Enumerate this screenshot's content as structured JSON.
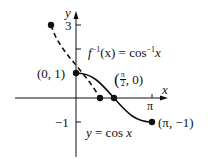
{
  "figure": {
    "type": "function-graph-with-inverse",
    "axes": {
      "x_label": "x",
      "y_label": "y",
      "y_ticks": [
        {
          "label": "3",
          "value": 3
        },
        {
          "label": "",
          "value": 2
        },
        {
          "label": "−1",
          "value": -1
        }
      ],
      "x_ticks": [
        {
          "label": "π",
          "value": 3.14159
        }
      ]
    },
    "curves": [
      {
        "name": "cosine",
        "label": "y = cos x",
        "style": "solid",
        "domain": "[0, π]"
      },
      {
        "name": "inverse-cosine",
        "label": "f⁻¹(x) = cos⁻¹ x",
        "style": "dashed",
        "domain": "[−1, 1]"
      }
    ],
    "points": [
      {
        "label": "(0, 1)"
      },
      {
        "label_num": "π",
        "label_den": "2",
        "label": "(π/2, 0)"
      },
      {
        "label": "(π, −1)"
      },
      {
        "label": "(−1, π)"
      }
    ],
    "labels": {
      "inverse_prefix": "f",
      "inverse_sup": "−1",
      "inverse_rest": "(x) = cos",
      "inverse_sup2": "−1",
      "inverse_var": "x",
      "cos_y": "y",
      "cos_eq": " = cos ",
      "cos_x": "x",
      "point_0_1": "(0, 1)",
      "point_pi_m1": "(π, −1)",
      "point_half_pi_open": "(",
      "point_half_pi_num": "π",
      "point_half_pi_den": "2",
      "point_half_pi_rest": ", 0)",
      "tick_3": "3",
      "tick_m1": "−1",
      "tick_pi": "π",
      "axis_x": "x",
      "axis_y": "y"
    },
    "colors": {
      "ink": "#111111",
      "background": "#ffffff"
    }
  }
}
